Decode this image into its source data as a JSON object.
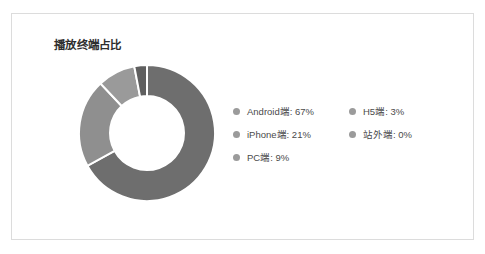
{
  "panel": {
    "border_color": "#dcdcdc",
    "background": "#ffffff"
  },
  "chart_data": {
    "type": "pie",
    "variant": "donut",
    "title": "播放终端占比",
    "xlabel": "",
    "ylabel": "",
    "legend_position": "right",
    "grid": false,
    "start_angle_deg": 0,
    "direction": "clockwise",
    "categories": [
      "Android端",
      "iPhone端",
      "PC端",
      "H5端",
      "站外端"
    ],
    "values": [
      67,
      21,
      9,
      3,
      0
    ],
    "unit": "%",
    "colors": [
      "#6e6e6e",
      "#8f8f8f",
      "#9a9a9a",
      "#5f5f5f",
      "#b4b4b4"
    ],
    "slices": [
      {
        "label": "Android端",
        "value": 67,
        "display": "Android端: 67%",
        "color": "#6e6e6e"
      },
      {
        "label": "iPhone端",
        "value": 21,
        "display": "iPhone端: 21%",
        "color": "#8f8f8f"
      },
      {
        "label": "PC端",
        "value": 9,
        "display": "PC端: 9%",
        "color": "#9a9a9a"
      },
      {
        "label": "H5端",
        "value": 3,
        "display": "H5端: 3%",
        "color": "#5f5f5f"
      },
      {
        "label": "站外端",
        "value": 0,
        "display": "站外端: 0%",
        "color": "#b4b4b4"
      }
    ]
  },
  "legend": {
    "marker_color": "#9b9b9b",
    "columns": [
      {
        "items": [
          {
            "label": "Android端: 67%",
            "marker": "legend-dot"
          },
          {
            "label": "iPhone端: 21%",
            "marker": "legend-dot"
          },
          {
            "label": "PC端: 9%",
            "marker": "legend-dot"
          }
        ]
      },
      {
        "items": [
          {
            "label": "H5端: 3%",
            "marker": "legend-dot"
          },
          {
            "label": "站外端: 0%",
            "marker": "legend-dot"
          }
        ]
      }
    ]
  }
}
